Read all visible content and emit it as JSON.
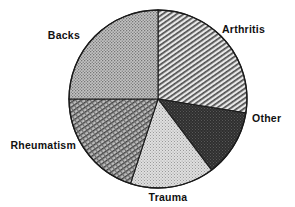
{
  "chart_data": {
    "type": "pie",
    "title": "",
    "subtitle": "",
    "xlabel": "",
    "ylabel": "",
    "legend_position": "none",
    "labels_position": "outside",
    "grid": false,
    "center": {
      "x": 158,
      "y": 99
    },
    "radius": 89,
    "start_angle_deg": 0,
    "direction": "clockwise",
    "categories": [
      "Arthritis",
      "Other",
      "Trauma",
      "Rheumatism",
      "Backs"
    ],
    "values": [
      27.5,
      12.2,
      15.3,
      20.0,
      25.0
    ],
    "units": "percent",
    "slices": [
      {
        "label": "Arthritis",
        "value": 27.5,
        "start_angle_deg": 0,
        "end_angle_deg": 99,
        "fill": "diagonal-hatch",
        "fill_color": "#a6a6a6",
        "label_x": 222,
        "label_y": 33,
        "label_anchor": "start"
      },
      {
        "label": "Other",
        "value": 12.2,
        "start_angle_deg": 99,
        "end_angle_deg": 143,
        "fill": "dark-stipple",
        "fill_color": "#3a3a3a",
        "label_x": 252,
        "label_y": 122,
        "label_anchor": "start"
      },
      {
        "label": "Trauma",
        "value": 15.3,
        "start_angle_deg": 143,
        "end_angle_deg": 198,
        "fill": "light-stipple",
        "fill_color": "#cfcfcf",
        "label_x": 168,
        "label_y": 201,
        "label_anchor": "middle"
      },
      {
        "label": "Rheumatism",
        "value": 20.0,
        "start_angle_deg": 198,
        "end_angle_deg": 270,
        "fill": "fine-crosshatch",
        "fill_color": "#8f8f8f",
        "label_x": 76,
        "label_y": 149,
        "label_anchor": "end"
      },
      {
        "label": "Backs",
        "value": 25.0,
        "start_angle_deg": 270,
        "end_angle_deg": 360,
        "fill": "medium-stipple",
        "fill_color": "#b0b0b0",
        "label_x": 80,
        "label_y": 39,
        "label_anchor": "end"
      }
    ],
    "colors": {
      "outline": "#1a1a1a",
      "background": "#ffffff",
      "text": "#111111"
    }
  }
}
